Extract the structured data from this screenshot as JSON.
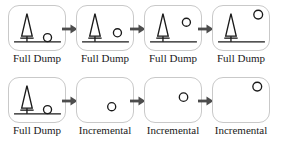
{
  "diagram": {
    "colors": {
      "panel_border": "#c9c9c9",
      "ink": "#1a1a1a",
      "arrow": "#4d4d4d",
      "background": "#ffffff"
    },
    "labels": {
      "full_dump": "Full Dump",
      "incremental": "Incremental"
    },
    "icons": {
      "tree": "tree-icon",
      "ground": "ground-line-icon",
      "circle": "circle-marker-icon",
      "arrow": "arrow-right-icon"
    },
    "rows": [
      {
        "name": "row-top",
        "cells": [
          {
            "label": "Full Dump",
            "has_tree": true,
            "has_ground": true,
            "has_circle": true,
            "circle_x": 40,
            "circle_y": 33,
            "circle_r": 4.2,
            "has_arrow": true
          },
          {
            "label": "Full Dump",
            "has_tree": true,
            "has_ground": true,
            "has_circle": true,
            "circle_x": 42,
            "circle_y": 28,
            "circle_r": 4.2,
            "has_arrow": true
          },
          {
            "label": "Full Dump",
            "has_tree": true,
            "has_ground": true,
            "has_circle": true,
            "circle_x": 43,
            "circle_y": 17,
            "circle_r": 4.2,
            "has_arrow": true
          },
          {
            "label": "Full Dump",
            "has_tree": true,
            "has_ground": true,
            "has_circle": true,
            "circle_x": 47,
            "circle_y": 9,
            "circle_r": 4.6,
            "has_arrow": false
          }
        ]
      },
      {
        "name": "row-bottom",
        "cells": [
          {
            "label": "Full Dump",
            "has_tree": true,
            "has_ground": true,
            "has_circle": true,
            "circle_x": 40,
            "circle_y": 33,
            "circle_r": 4.2,
            "has_arrow": true
          },
          {
            "label": "Incremental",
            "has_tree": false,
            "has_ground": false,
            "has_circle": true,
            "circle_x": 36,
            "circle_y": 30,
            "circle_r": 4.2,
            "has_arrow": true
          },
          {
            "label": "Incremental",
            "has_tree": false,
            "has_ground": false,
            "has_circle": true,
            "circle_x": 40,
            "circle_y": 20,
            "circle_r": 4.4,
            "has_arrow": true
          },
          {
            "label": "Incremental",
            "has_tree": false,
            "has_ground": false,
            "has_circle": true,
            "circle_x": 46,
            "circle_y": 9,
            "circle_r": 4.6,
            "has_arrow": false
          }
        ]
      }
    ]
  }
}
